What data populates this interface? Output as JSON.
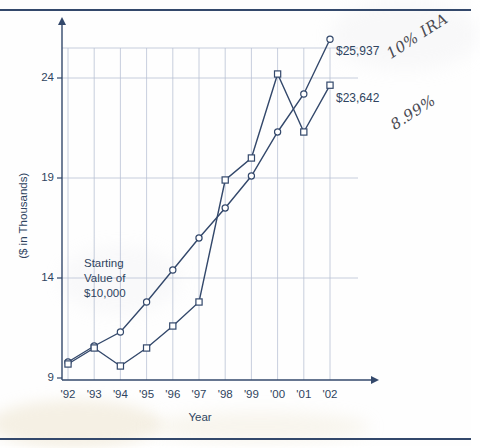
{
  "page": {
    "top_rule": "horizontal-rule",
    "bottom_rule": "horizontal-rule"
  },
  "annotations": {
    "starting_note": "Starting\nValue of\n$10,000",
    "starting_note_lines": [
      "Starting",
      "Value of",
      "$10,000"
    ],
    "handwritten": [
      {
        "name": "handwritten-10pct-ira",
        "text": "10% IRA"
      },
      {
        "name": "handwritten-899pct",
        "text": "8.99%"
      }
    ],
    "end_labels": [
      {
        "name": "end-label-series-a",
        "text": "$25,937"
      },
      {
        "name": "end-label-series-b",
        "text": "$23,642"
      }
    ]
  },
  "chart_data": {
    "type": "line",
    "title": "",
    "xlabel": "Year",
    "ylabel": "($ in Thousands)",
    "categories": [
      "'92",
      "'93",
      "'94",
      "'95",
      "'96",
      "'97",
      "'98",
      "'99",
      "'00",
      "'01",
      "'02"
    ],
    "x_tick_labels": [
      "'92",
      "'93",
      "'94",
      "'95",
      "'96",
      "'97",
      "'98",
      "'99",
      "'00",
      "'01",
      "'02"
    ],
    "y_tick_labels": [
      "9",
      "14",
      "19",
      "24"
    ],
    "y_ticks": [
      9,
      14,
      19,
      24
    ],
    "ylim": [
      9,
      27.2
    ],
    "xlim": [
      0,
      10
    ],
    "grid": true,
    "grid_color": "#b9c2d4",
    "legend": "none",
    "series": [
      {
        "name": "10% IRA",
        "marker": "circle",
        "end_label": "$25,937",
        "end_value_dollars": 25937,
        "color": "#33486b",
        "values": [
          9.8,
          10.6,
          11.3,
          12.8,
          14.4,
          16.0,
          17.5,
          19.1,
          21.3,
          23.2,
          25.94
        ]
      },
      {
        "name": "8.99%",
        "marker": "square",
        "end_label": "$23,642",
        "end_value_dollars": 23642,
        "color": "#33486b",
        "values": [
          9.7,
          10.5,
          9.6,
          10.5,
          11.6,
          12.8,
          18.9,
          20.0,
          24.2,
          21.3,
          23.64
        ]
      }
    ]
  }
}
